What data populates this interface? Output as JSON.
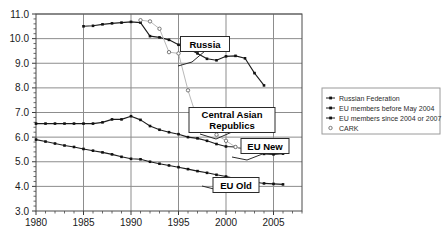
{
  "chart_data": {
    "type": "line",
    "title": "",
    "xlabel": "",
    "ylabel": "",
    "xlim": [
      1980,
      2008
    ],
    "ylim": [
      3.0,
      11.0
    ],
    "grid": true,
    "legend_position": "right",
    "x_ticks": [
      "1980",
      "1985",
      "1990",
      "1995",
      "2000",
      "2005"
    ],
    "x_tick_values": [
      1980,
      1985,
      1990,
      1995,
      2000,
      2005
    ],
    "y_ticks": [
      "3.0",
      "4.0",
      "5.0",
      "6.0",
      "7.0",
      "8.0",
      "9.0",
      "10.0",
      "11.0"
    ],
    "y_tick_values": [
      3.0,
      4.0,
      5.0,
      6.0,
      7.0,
      8.0,
      9.0,
      10.0,
      11.0
    ],
    "series": [
      {
        "name": "Russian Federation",
        "marker": "filled-square",
        "line": "solid-dark",
        "x": [
          1985,
          1986,
          1987,
          1988,
          1989,
          1990,
          1991,
          1992,
          1993,
          1994,
          1995,
          1996,
          1997,
          1998,
          1999,
          2000,
          2001,
          2002,
          2003,
          2004
        ],
        "values": [
          10.5,
          10.52,
          10.58,
          10.62,
          10.65,
          10.68,
          10.65,
          10.1,
          10.05,
          9.95,
          9.75,
          9.6,
          9.4,
          9.18,
          9.12,
          9.28,
          9.3,
          9.2,
          8.6,
          8.1
        ]
      },
      {
        "name": "EU members before May 2004",
        "marker": "filled-square",
        "line": "solid-dark",
        "x": [
          1980,
          1981,
          1982,
          1983,
          1984,
          1985,
          1986,
          1987,
          1988,
          1989,
          1990,
          1991,
          1992,
          1993,
          1994,
          1995,
          1996,
          1997,
          1998,
          1999,
          2000,
          2001,
          2002,
          2003,
          2004,
          2005,
          2006
        ],
        "values": [
          5.9,
          5.82,
          5.74,
          5.66,
          5.6,
          5.52,
          5.45,
          5.38,
          5.3,
          5.2,
          5.12,
          5.1,
          5.0,
          4.92,
          4.85,
          4.78,
          4.7,
          4.62,
          4.55,
          4.47,
          4.4,
          4.32,
          4.25,
          4.18,
          4.12,
          4.1,
          4.08
        ]
      },
      {
        "name": "EU members since 2004 or 2007",
        "marker": "filled-square",
        "line": "solid-dark",
        "x": [
          1980,
          1981,
          1982,
          1983,
          1984,
          1985,
          1986,
          1987,
          1988,
          1989,
          1990,
          1991,
          1992,
          1993,
          1994,
          1995,
          1996,
          1997,
          1998,
          1999,
          2000,
          2001,
          2002,
          2003,
          2004,
          2005,
          2006
        ],
        "values": [
          6.55,
          6.55,
          6.55,
          6.55,
          6.55,
          6.55,
          6.55,
          6.6,
          6.72,
          6.72,
          6.85,
          6.7,
          6.45,
          6.3,
          6.2,
          6.12,
          6.0,
          5.95,
          5.85,
          5.72,
          5.62,
          5.6,
          5.5,
          5.42,
          5.32,
          5.3,
          5.33
        ]
      },
      {
        "name": "CARK",
        "marker": "open-diamond",
        "line": "light-grey",
        "x": [
          1991,
          1992,
          1993,
          1994,
          1995,
          1996,
          1997,
          1998,
          1999,
          2000,
          2001,
          2002
        ],
        "values": [
          10.75,
          10.7,
          10.4,
          9.45,
          9.4,
          7.9,
          6.7,
          6.55,
          6.1,
          5.85,
          5.6,
          5.5
        ]
      }
    ],
    "annotations": [
      {
        "label": "Russia",
        "series": "Russian Federation"
      },
      {
        "label": "Central Asian Republics",
        "series": "CARK"
      },
      {
        "label": "EU New",
        "series": "EU members since 2004 or 2007"
      },
      {
        "label": "EU Old",
        "series": "EU members before May 2004"
      }
    ]
  },
  "legend": {
    "items": [
      {
        "label": "Russian Federation"
      },
      {
        "label": "EU members before May 2004"
      },
      {
        "label": "EU members since 2004 or 2007"
      },
      {
        "label": "CARK"
      }
    ]
  }
}
